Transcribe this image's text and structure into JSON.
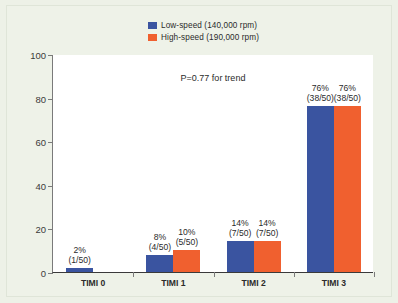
{
  "chart_data": {
    "type": "bar",
    "title": "",
    "subtitle": "",
    "xlabel": "",
    "ylabel": "",
    "ylim": [
      0,
      100
    ],
    "yticks": [
      0,
      20,
      40,
      60,
      80,
      100
    ],
    "grid": false,
    "legend_position": "top-center",
    "categories": [
      "TIMI 0",
      "TIMI 1",
      "TIMI 2",
      "TIMI 3"
    ],
    "series": [
      {
        "name": "Low-speed (140,000 rpm)",
        "color": "#3a54a0",
        "values": [
          2,
          8,
          14,
          76
        ],
        "labels": [
          "2%",
          "8%",
          "14%",
          "76%"
        ],
        "sublabels": [
          "(1/50)",
          "(4/50)",
          "(7/50)",
          "(38/50)"
        ]
      },
      {
        "name": "High-speed (190,000 rpm)",
        "color": "#f0602f",
        "values": [
          0,
          10,
          14,
          76
        ],
        "labels": [
          "",
          "10%",
          "14%",
          "76%"
        ],
        "sublabels": [
          "",
          "(5/50)",
          "(7/50)",
          "(38/50)"
        ]
      }
    ],
    "annotations": [
      {
        "text": "P=0.77 for trend"
      }
    ]
  },
  "legend": {
    "items": [
      {
        "label": "Low-speed (140,000 rpm)",
        "color": "#3a54a0"
      },
      {
        "label": "High-speed (190,000 rpm)",
        "color": "#f0602f"
      }
    ]
  },
  "axis": {
    "y_tick_labels": [
      "0",
      "20",
      "40",
      "60",
      "80",
      "100"
    ],
    "x_tick_labels": [
      "TIMI 0",
      "TIMI 1",
      "TIMI 2",
      "TIMI 3"
    ]
  },
  "annotation": {
    "p_value_text": "P=0.77 for trend"
  },
  "colors": {
    "low_speed": "#3a54a0",
    "high_speed": "#f0602f",
    "background": "#edf1e7",
    "plot_background": "#ffffff",
    "axis": "#3a3a3a"
  }
}
